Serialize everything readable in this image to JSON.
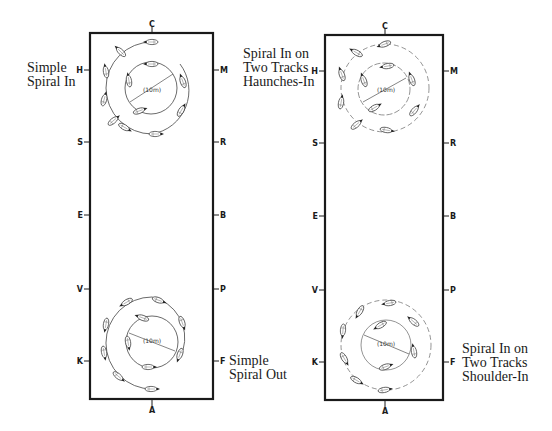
{
  "colors": {
    "background": "#ffffff",
    "ink": "#1a1a1a",
    "path": "#444444"
  },
  "arenas": [
    {
      "id": "left",
      "letters": {
        "top": "C",
        "bottom": "A",
        "left": [
          "H",
          "S",
          "E",
          "V",
          "K"
        ],
        "right": [
          "M",
          "R",
          "B",
          "P",
          "F"
        ]
      },
      "figures": [
        {
          "id": "simple-spiral-in",
          "caption": [
            "Simple",
            "Spiral In"
          ],
          "radius_label": "(10m)"
        },
        {
          "id": "simple-spiral-out",
          "caption": [
            "Simple",
            "Spiral Out"
          ],
          "radius_label": "(10m)"
        }
      ]
    },
    {
      "id": "right",
      "letters": {
        "top": "C",
        "bottom": "A",
        "left": [
          "H",
          "S",
          "E",
          "V",
          "K"
        ],
        "right": [
          "M",
          "R",
          "B",
          "P",
          "F"
        ]
      },
      "figures": [
        {
          "id": "spiral-in-haunches-in",
          "caption": [
            "Spiral In on",
            "Two Tracks",
            "Haunches-In"
          ],
          "radius_label": "(10m)"
        },
        {
          "id": "spiral-in-shoulder-in",
          "caption": [
            "Spiral In on",
            "Two Tracks",
            "Shoulder-In"
          ],
          "radius_label": "(10m)"
        }
      ]
    }
  ]
}
